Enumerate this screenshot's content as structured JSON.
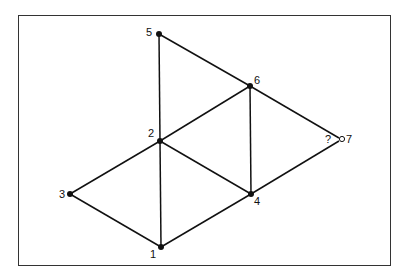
{
  "diagram": {
    "nodes": [
      {
        "id": "1",
        "label": "1",
        "x": 161,
        "y": 247,
        "filled": true
      },
      {
        "id": "2",
        "label": "2",
        "x": 160,
        "y": 141,
        "filled": true
      },
      {
        "id": "3",
        "label": "3",
        "x": 70,
        "y": 194,
        "filled": true
      },
      {
        "id": "4",
        "label": "4",
        "x": 251,
        "y": 194,
        "filled": true
      },
      {
        "id": "5",
        "label": "5",
        "x": 159,
        "y": 34,
        "filled": true
      },
      {
        "id": "6",
        "label": "6",
        "x": 250,
        "y": 86,
        "filled": true
      },
      {
        "id": "7",
        "label": "7",
        "x": 342,
        "y": 139,
        "filled": false
      }
    ],
    "edges": [
      [
        "5",
        "2"
      ],
      [
        "5",
        "6"
      ],
      [
        "6",
        "2"
      ],
      [
        "6",
        "4"
      ],
      [
        "6",
        "7"
      ],
      [
        "2",
        "3"
      ],
      [
        "2",
        "1"
      ],
      [
        "2",
        "4"
      ],
      [
        "3",
        "1"
      ],
      [
        "1",
        "4"
      ],
      [
        "4",
        "7"
      ]
    ],
    "unknown_marker": "?"
  }
}
